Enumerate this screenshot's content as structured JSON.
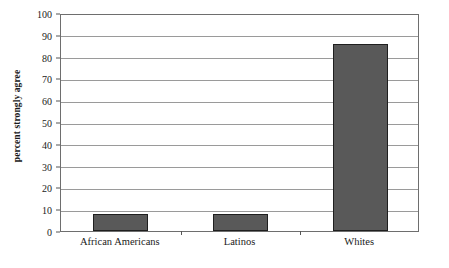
{
  "chart_data": {
    "type": "bar",
    "title": "",
    "xlabel": "",
    "ylabel": "percent strongly agree",
    "categories": [
      "African Americans",
      "Latinos",
      "Whites"
    ],
    "values": [
      8,
      8,
      86
    ],
    "ylim": [
      0,
      100
    ],
    "ytick_labels": [
      "0",
      "10",
      "20",
      "30",
      "40",
      "50",
      "60",
      "70",
      "80",
      "90",
      "100"
    ],
    "ytick_values": [
      0,
      10,
      20,
      30,
      40,
      50,
      60,
      70,
      80,
      90,
      100
    ],
    "grid": true,
    "legend": "none",
    "bar_color": "#595959",
    "bar_edge_color": "#1f1f1f",
    "gridline_color": "#9a9a9a",
    "frame_color": "#6e6e6e",
    "background_color": "#ffffff"
  }
}
